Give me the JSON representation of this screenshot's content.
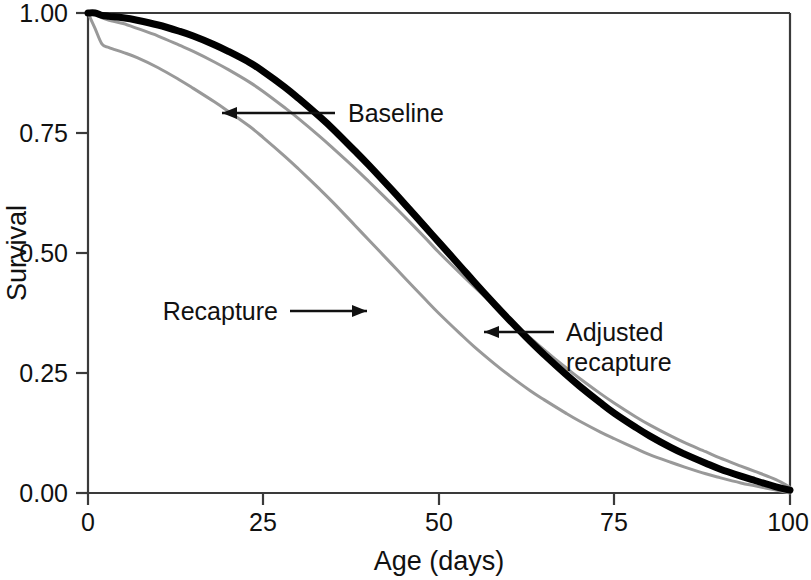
{
  "chart_data": {
    "type": "line",
    "title": "",
    "xlabel": "Age (days)",
    "ylabel": "Survival",
    "xlim": [
      0,
      100
    ],
    "ylim": [
      0.0,
      1.0
    ],
    "grid": false,
    "legend_position": "inline-annotations",
    "xticks": [
      "0",
      "25",
      "50",
      "75",
      "100"
    ],
    "xtick_values": [
      0,
      25,
      50,
      75,
      100
    ],
    "yticks": [
      "0.00",
      "0.25",
      "0.50",
      "0.75",
      "1.00"
    ],
    "ytick_values": [
      0.0,
      0.25,
      0.5,
      0.75,
      1.0
    ],
    "x": [
      0,
      1,
      2,
      3,
      5,
      7,
      10,
      13,
      15,
      18,
      20,
      23,
      25,
      28,
      30,
      33,
      35,
      38,
      40,
      43,
      45,
      48,
      50,
      53,
      55,
      58,
      60,
      63,
      65,
      68,
      70,
      73,
      75,
      78,
      80,
      83,
      85,
      88,
      90,
      93,
      95,
      98,
      100
    ],
    "series": [
      {
        "name": "Baseline",
        "color": "#000000",
        "width": 7,
        "values": [
          1.0,
          1.0,
          0.995,
          0.993,
          0.99,
          0.985,
          0.975,
          0.962,
          0.952,
          0.934,
          0.92,
          0.897,
          0.878,
          0.846,
          0.822,
          0.784,
          0.757,
          0.713,
          0.683,
          0.636,
          0.604,
          0.555,
          0.522,
          0.473,
          0.44,
          0.392,
          0.361,
          0.316,
          0.288,
          0.248,
          0.223,
          0.188,
          0.166,
          0.137,
          0.119,
          0.095,
          0.081,
          0.062,
          0.05,
          0.035,
          0.026,
          0.013,
          0.006
        ]
      },
      {
        "name": "Adjusted recapture",
        "color": "#999999",
        "width": 3,
        "values": [
          1.0,
          0.997,
          0.99,
          0.985,
          0.978,
          0.968,
          0.952,
          0.933,
          0.92,
          0.898,
          0.882,
          0.856,
          0.836,
          0.803,
          0.78,
          0.743,
          0.717,
          0.677,
          0.649,
          0.606,
          0.577,
          0.532,
          0.501,
          0.458,
          0.43,
          0.389,
          0.362,
          0.323,
          0.298,
          0.262,
          0.239,
          0.207,
          0.187,
          0.159,
          0.142,
          0.119,
          0.105,
          0.086,
          0.073,
          0.056,
          0.045,
          0.028,
          0.012
        ]
      },
      {
        "name": "Recapture",
        "color": "#999999",
        "width": 3,
        "values": [
          1.0,
          0.968,
          0.935,
          0.928,
          0.918,
          0.907,
          0.886,
          0.861,
          0.843,
          0.815,
          0.795,
          0.764,
          0.74,
          0.702,
          0.675,
          0.633,
          0.604,
          0.558,
          0.527,
          0.481,
          0.45,
          0.404,
          0.374,
          0.332,
          0.305,
          0.268,
          0.245,
          0.213,
          0.194,
          0.167,
          0.15,
          0.127,
          0.113,
          0.093,
          0.08,
          0.064,
          0.054,
          0.04,
          0.032,
          0.021,
          0.015,
          0.006,
          0.0
        ]
      }
    ],
    "annotations": [
      {
        "id": "baseline",
        "label": "Baseline",
        "arrow_direction": "left",
        "points_to_series": "Baseline"
      },
      {
        "id": "recapture",
        "label": "Recapture",
        "arrow_direction": "right",
        "points_to_series": "Recapture"
      },
      {
        "id": "adjusted-recapture",
        "label_line1": "Adjusted",
        "label_line2": "recapture",
        "arrow_direction": "left",
        "points_to_series": "Adjusted recapture"
      }
    ]
  }
}
